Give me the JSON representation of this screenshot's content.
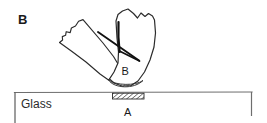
{
  "figure": {
    "panel_letter": "B",
    "labels": {
      "substrate": "Glass",
      "interface_point": "A",
      "specimen_point": "B"
    },
    "colors": {
      "ink": "#1a1a1a",
      "outline": "#2b2b2b",
      "substrate_rule": "#6e6e6e",
      "background": "#ffffff",
      "hatch": "#333333"
    },
    "geometry": {
      "width": 267,
      "height": 123,
      "substrate_box": {
        "x": 14,
        "y": 92,
        "right": 252,
        "bottom": 123
      },
      "contact_patch": {
        "x": 112,
        "y": 93,
        "width": 32,
        "height": 6
      },
      "curved_contact_band": {
        "x_start": 108,
        "x_end": 143,
        "y": 84
      }
    }
  }
}
